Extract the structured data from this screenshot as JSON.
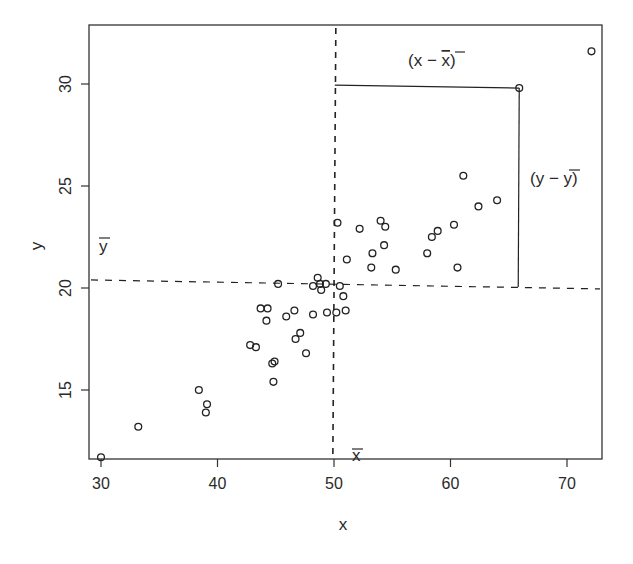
{
  "chart_data": {
    "type": "scatter",
    "title": "",
    "xlabel": "x",
    "ylabel": "y",
    "xlim": [
      28.5,
      73.3
    ],
    "ylim": [
      10.6,
      32.7
    ],
    "xticks": [
      30,
      40,
      50,
      60,
      70
    ],
    "yticks": [
      15,
      20,
      25,
      30
    ],
    "grid": false,
    "legend": null,
    "marker": "open-circle",
    "points": [
      {
        "x": 30.0,
        "y": 11.7
      },
      {
        "x": 33.2,
        "y": 13.2
      },
      {
        "x": 38.4,
        "y": 15.0
      },
      {
        "x": 39.1,
        "y": 14.3
      },
      {
        "x": 39.0,
        "y": 13.9
      },
      {
        "x": 42.8,
        "y": 17.2
      },
      {
        "x": 43.3,
        "y": 17.1
      },
      {
        "x": 43.7,
        "y": 19.0
      },
      {
        "x": 44.3,
        "y": 19.0
      },
      {
        "x": 44.2,
        "y": 18.4
      },
      {
        "x": 44.7,
        "y": 16.3
      },
      {
        "x": 44.9,
        "y": 16.4
      },
      {
        "x": 44.8,
        "y": 15.4
      },
      {
        "x": 45.2,
        "y": 20.2
      },
      {
        "x": 45.9,
        "y": 18.6
      },
      {
        "x": 46.6,
        "y": 18.9
      },
      {
        "x": 46.7,
        "y": 17.5
      },
      {
        "x": 47.1,
        "y": 17.8
      },
      {
        "x": 47.6,
        "y": 16.8
      },
      {
        "x": 48.2,
        "y": 18.7
      },
      {
        "x": 48.6,
        "y": 20.5
      },
      {
        "x": 48.2,
        "y": 20.1
      },
      {
        "x": 48.8,
        "y": 20.2
      },
      {
        "x": 48.9,
        "y": 19.9
      },
      {
        "x": 49.3,
        "y": 20.2
      },
      {
        "x": 49.4,
        "y": 18.8
      },
      {
        "x": 50.2,
        "y": 18.8
      },
      {
        "x": 50.5,
        "y": 20.1
      },
      {
        "x": 50.8,
        "y": 19.6
      },
      {
        "x": 51.0,
        "y": 18.9
      },
      {
        "x": 50.3,
        "y": 23.2
      },
      {
        "x": 51.1,
        "y": 21.4
      },
      {
        "x": 52.2,
        "y": 22.9
      },
      {
        "x": 53.2,
        "y": 21.0
      },
      {
        "x": 53.3,
        "y": 21.7
      },
      {
        "x": 54.0,
        "y": 23.3
      },
      {
        "x": 54.4,
        "y": 23.0
      },
      {
        "x": 54.3,
        "y": 22.1
      },
      {
        "x": 55.3,
        "y": 20.9
      },
      {
        "x": 58.0,
        "y": 21.7
      },
      {
        "x": 58.4,
        "y": 22.5
      },
      {
        "x": 58.9,
        "y": 22.8
      },
      {
        "x": 60.3,
        "y": 23.1
      },
      {
        "x": 60.6,
        "y": 21.0
      },
      {
        "x": 61.1,
        "y": 25.5
      },
      {
        "x": 62.4,
        "y": 24.0
      },
      {
        "x": 64.0,
        "y": 24.3
      },
      {
        "x": 65.9,
        "y": 29.8
      },
      {
        "x": 72.1,
        "y": 31.6
      }
    ],
    "reference_lines": {
      "x_mean": {
        "value": 49.9,
        "style": "dashed",
        "label": "x̄"
      },
      "y_mean": {
        "value": 20.2,
        "style": "dashed",
        "label": "ȳ"
      }
    },
    "highlighted_point": {
      "x": 65.9,
      "y": 29.8
    },
    "annotations": [
      {
        "text": "(x − x̄)",
        "meaning": "horizontal deviation of highlighted point from x mean"
      },
      {
        "text": "(y − ȳ)",
        "meaning": "vertical deviation of highlighted point from y mean"
      },
      {
        "text": "x̄",
        "position": "near bottom of vertical mean line"
      },
      {
        "text": "ȳ",
        "position": "near left end of horizontal mean line"
      }
    ]
  },
  "labels": {
    "xlabel": "x",
    "ylabel": "y",
    "xbar_label": "x",
    "ybar_label": "y",
    "dev_x_label": {
      "open": "(x − ",
      "bar": "x",
      "close": ")"
    },
    "dev_y_label": {
      "open": "(y − ",
      "bar": "y",
      "close": ")"
    },
    "xtick_labels": [
      "30",
      "40",
      "50",
      "60",
      "70"
    ],
    "ytick_labels": [
      "15",
      "20",
      "25",
      "30"
    ]
  }
}
